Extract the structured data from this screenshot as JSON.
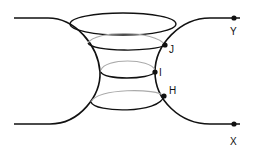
{
  "diagram": {
    "title": "",
    "labels": {
      "J": "J",
      "I": "I",
      "H": "H",
      "Y": "Y",
      "X": "X"
    },
    "colors": {
      "stroke": "#111111",
      "hidden_stroke": "#aaaaaa",
      "background": "#ffffff"
    },
    "points": [
      {
        "name": "J",
        "x": 165,
        "y": 45
      },
      {
        "name": "I",
        "x": 155,
        "y": 72
      },
      {
        "name": "H",
        "x": 164,
        "y": 96
      },
      {
        "name": "Y",
        "x": 234,
        "y": 18
      },
      {
        "name": "X",
        "x": 234,
        "y": 124
      }
    ]
  }
}
